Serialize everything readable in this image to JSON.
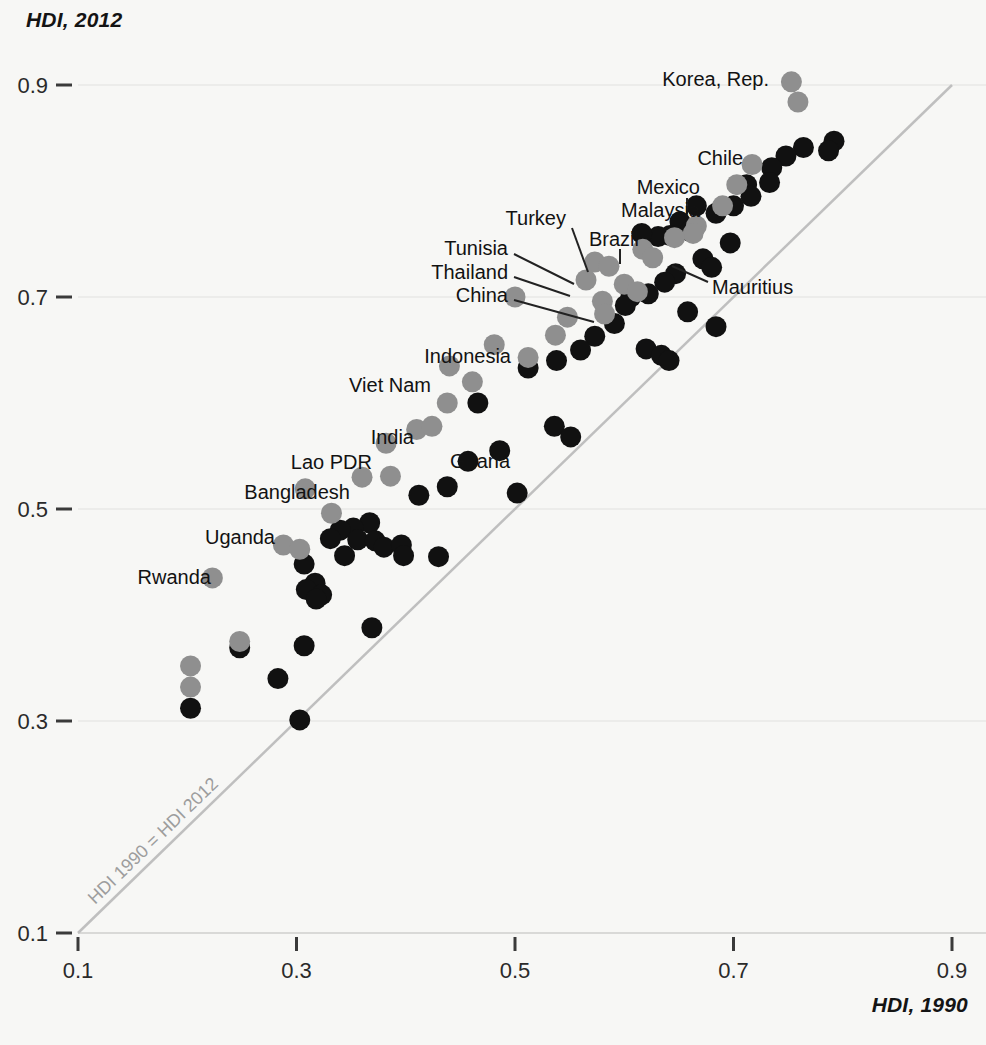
{
  "chart_data": {
    "type": "scatter",
    "title": "",
    "xlabel": "HDI, 1990",
    "ylabel": "HDI, 2012",
    "xlim": [
      0.1,
      0.9
    ],
    "ylim": [
      0.1,
      0.9
    ],
    "xticks": [
      "0.1",
      "0.3",
      "0.5",
      "0.7",
      "0.9"
    ],
    "xtickvals": [
      0.1,
      0.3,
      0.5,
      0.7,
      0.9
    ],
    "yticks": [
      "0.1",
      "0.3",
      "0.5",
      "0.7",
      "0.9"
    ],
    "ytickvals": [
      0.1,
      0.3,
      0.5,
      0.7,
      0.9
    ],
    "grid": "horizontal-faint",
    "legend": "none",
    "reference_line": {
      "label": "HDI 1990 = HDI 2012",
      "from": [
        0.1,
        0.1
      ],
      "to": [
        0.9,
        0.9
      ],
      "color": "#bfbfbf"
    },
    "series": [
      {
        "name": "highlighted-countries",
        "color": "#8f8f8f",
        "points": [
          {
            "label": "Korea, Rep.",
            "x": 0.753,
            "y": 0.903
          },
          {
            "label": "",
            "x": 0.759,
            "y": 0.884
          },
          {
            "label": "Chile",
            "x": 0.717,
            "y": 0.825
          },
          {
            "label": "",
            "x": 0.703,
            "y": 0.806
          },
          {
            "label": "",
            "x": 0.69,
            "y": 0.786
          },
          {
            "label": "Mexico",
            "x": 0.666,
            "y": 0.767
          },
          {
            "label": "Malaysia",
            "x": 0.663,
            "y": 0.76
          },
          {
            "label": "",
            "x": 0.646,
            "y": 0.756
          },
          {
            "label": "Brazil",
            "x": 0.617,
            "y": 0.745
          },
          {
            "label": "",
            "x": 0.626,
            "y": 0.737
          },
          {
            "label": "Turkey",
            "x": 0.573,
            "y": 0.733
          },
          {
            "label": "",
            "x": 0.586,
            "y": 0.729
          },
          {
            "label": "Tunisia",
            "x": 0.565,
            "y": 0.716
          },
          {
            "label": "",
            "x": 0.6,
            "y": 0.712
          },
          {
            "label": "",
            "x": 0.612,
            "y": 0.705
          },
          {
            "label": "Thailand",
            "x": 0.58,
            "y": 0.696
          },
          {
            "label": "",
            "x": 0.582,
            "y": 0.684
          },
          {
            "label": "China",
            "x": 0.5,
            "y": 0.7
          },
          {
            "label": "",
            "x": 0.548,
            "y": 0.681
          },
          {
            "label": "",
            "x": 0.537,
            "y": 0.664
          },
          {
            "label": "Indonesia",
            "x": 0.481,
            "y": 0.655
          },
          {
            "label": "",
            "x": 0.512,
            "y": 0.643
          },
          {
            "label": "Viet Nam",
            "x": 0.44,
            "y": 0.635
          },
          {
            "label": "",
            "x": 0.461,
            "y": 0.62
          },
          {
            "label": "",
            "x": 0.438,
            "y": 0.6
          },
          {
            "label": "India",
            "x": 0.41,
            "y": 0.575
          },
          {
            "label": "Ghana",
            "x": 0.424,
            "y": 0.578
          },
          {
            "label": "Lao PDR",
            "x": 0.382,
            "y": 0.562
          },
          {
            "label": "Bangladesh",
            "x": 0.36,
            "y": 0.53
          },
          {
            "label": "",
            "x": 0.386,
            "y": 0.531
          },
          {
            "label": "",
            "x": 0.308,
            "y": 0.519
          },
          {
            "label": "",
            "x": 0.332,
            "y": 0.496
          },
          {
            "label": "Uganda",
            "x": 0.288,
            "y": 0.466
          },
          {
            "label": "",
            "x": 0.303,
            "y": 0.462
          },
          {
            "label": "Rwanda",
            "x": 0.223,
            "y": 0.435
          },
          {
            "label": "",
            "x": 0.248,
            "y": 0.375
          },
          {
            "label": "",
            "x": 0.203,
            "y": 0.352
          },
          {
            "label": "",
            "x": 0.203,
            "y": 0.332
          }
        ]
      },
      {
        "name": "other-countries",
        "color": "#111111",
        "points": [
          {
            "x": 0.792,
            "y": 0.847
          },
          {
            "x": 0.787,
            "y": 0.838
          },
          {
            "x": 0.764,
            "y": 0.841
          },
          {
            "x": 0.748,
            "y": 0.833
          },
          {
            "x": 0.735,
            "y": 0.822
          },
          {
            "x": 0.733,
            "y": 0.808
          },
          {
            "x": 0.712,
            "y": 0.806
          },
          {
            "x": 0.716,
            "y": 0.795
          },
          {
            "x": 0.7,
            "y": 0.786
          },
          {
            "x": 0.684,
            "y": 0.779
          },
          {
            "x": 0.666,
            "y": 0.786
          },
          {
            "x": 0.651,
            "y": 0.771
          },
          {
            "x": 0.66,
            "y": 0.762
          },
          {
            "x": 0.642,
            "y": 0.758
          },
          {
            "x": 0.631,
            "y": 0.757
          },
          {
            "x": 0.616,
            "y": 0.76
          },
          {
            "x": 0.697,
            "y": 0.751
          },
          {
            "x": 0.672,
            "y": 0.736
          },
          {
            "x": 0.68,
            "y": 0.728
          },
          {
            "x": 0.647,
            "y": 0.722
          },
          {
            "x": 0.637,
            "y": 0.714
          },
          {
            "x": 0.622,
            "y": 0.703
          },
          {
            "x": 0.606,
            "y": 0.7
          },
          {
            "x": 0.601,
            "y": 0.692
          },
          {
            "x": 0.591,
            "y": 0.675
          },
          {
            "x": 0.658,
            "y": 0.686
          },
          {
            "x": 0.684,
            "y": 0.672
          },
          {
            "x": 0.573,
            "y": 0.663
          },
          {
            "x": 0.56,
            "y": 0.65
          },
          {
            "x": 0.62,
            "y": 0.651
          },
          {
            "x": 0.634,
            "y": 0.645
          },
          {
            "x": 0.641,
            "y": 0.64
          },
          {
            "x": 0.538,
            "y": 0.64
          },
          {
            "x": 0.512,
            "y": 0.633
          },
          {
            "x": 0.466,
            "y": 0.6
          },
          {
            "x": 0.536,
            "y": 0.578
          },
          {
            "x": 0.551,
            "y": 0.568
          },
          {
            "x": 0.486,
            "y": 0.555
          },
          {
            "x": 0.457,
            "y": 0.545
          },
          {
            "x": 0.438,
            "y": 0.521
          },
          {
            "x": 0.502,
            "y": 0.515
          },
          {
            "x": 0.412,
            "y": 0.513
          },
          {
            "x": 0.367,
            "y": 0.487
          },
          {
            "x": 0.352,
            "y": 0.482
          },
          {
            "x": 0.34,
            "y": 0.48
          },
          {
            "x": 0.331,
            "y": 0.472
          },
          {
            "x": 0.356,
            "y": 0.471
          },
          {
            "x": 0.372,
            "y": 0.47
          },
          {
            "x": 0.38,
            "y": 0.464
          },
          {
            "x": 0.396,
            "y": 0.466
          },
          {
            "x": 0.398,
            "y": 0.456
          },
          {
            "x": 0.344,
            "y": 0.456
          },
          {
            "x": 0.43,
            "y": 0.455
          },
          {
            "x": 0.307,
            "y": 0.448
          },
          {
            "x": 0.317,
            "y": 0.43
          },
          {
            "x": 0.309,
            "y": 0.424
          },
          {
            "x": 0.323,
            "y": 0.419
          },
          {
            "x": 0.318,
            "y": 0.415
          },
          {
            "x": 0.369,
            "y": 0.388
          },
          {
            "x": 0.307,
            "y": 0.371
          },
          {
            "x": 0.248,
            "y": 0.369
          },
          {
            "x": 0.283,
            "y": 0.34
          },
          {
            "x": 0.203,
            "y": 0.312
          },
          {
            "x": 0.303,
            "y": 0.301
          }
        ]
      }
    ],
    "labels": [
      {
        "text": "Korea, Rep.",
        "x": 769,
        "y": 79,
        "align": "r",
        "leader": null
      },
      {
        "text": "Chile",
        "x": 743,
        "y": 158,
        "align": "r",
        "leader": null
      },
      {
        "text": "Mexico",
        "x": 700,
        "y": 187,
        "align": "r",
        "leader": {
          "x1": 687,
          "y1": 198,
          "x2": 687,
          "y2": 214
        }
      },
      {
        "text": "Malaysia",
        "x": 700,
        "y": 210,
        "align": "r",
        "leader": null
      },
      {
        "text": "Brazil",
        "x": 639,
        "y": 239,
        "align": "r",
        "leader": {
          "x1": 620,
          "y1": 249,
          "x2": 620,
          "y2": 264
        }
      },
      {
        "text": "Turkey",
        "x": 566,
        "y": 218,
        "align": "r",
        "leader": {
          "x1": 572,
          "y1": 228,
          "x2": 588,
          "y2": 272
        }
      },
      {
        "text": "Tunisia",
        "x": 508,
        "y": 248,
        "align": "r",
        "leader": {
          "x1": 514,
          "y1": 254,
          "x2": 574,
          "y2": 284
        }
      },
      {
        "text": "Thailand",
        "x": 508,
        "y": 272,
        "align": "r",
        "leader": {
          "x1": 514,
          "y1": 277,
          "x2": 570,
          "y2": 296
        }
      },
      {
        "text": "China",
        "x": 508,
        "y": 295,
        "align": "r",
        "leader": {
          "x1": 514,
          "y1": 300,
          "x2": 594,
          "y2": 322
        }
      },
      {
        "text": "Mauritius",
        "x": 712,
        "y": 287,
        "align": "l",
        "leader": {
          "x1": 708,
          "y1": 282,
          "x2": 672,
          "y2": 266
        }
      },
      {
        "text": "Indonesia",
        "x": 511,
        "y": 356,
        "align": "r",
        "leader": null
      },
      {
        "text": "Viet Nam",
        "x": 431,
        "y": 385,
        "align": "r",
        "leader": null
      },
      {
        "text": "India",
        "x": 414,
        "y": 437,
        "align": "r",
        "leader": null
      },
      {
        "text": "Ghana",
        "x": 450,
        "y": 461,
        "align": "l",
        "leader": null
      },
      {
        "text": "Lao PDR",
        "x": 372,
        "y": 462,
        "align": "r",
        "leader": null
      },
      {
        "text": "Bangladesh",
        "x": 350,
        "y": 492,
        "align": "r",
        "leader": null
      },
      {
        "text": "Uganda",
        "x": 275,
        "y": 537,
        "align": "r",
        "leader": null
      },
      {
        "text": "Rwanda",
        "x": 211,
        "y": 577,
        "align": "r",
        "leader": null
      }
    ]
  },
  "axes": {
    "y_title": "HDI, 2012",
    "x_title": "HDI, 1990"
  }
}
